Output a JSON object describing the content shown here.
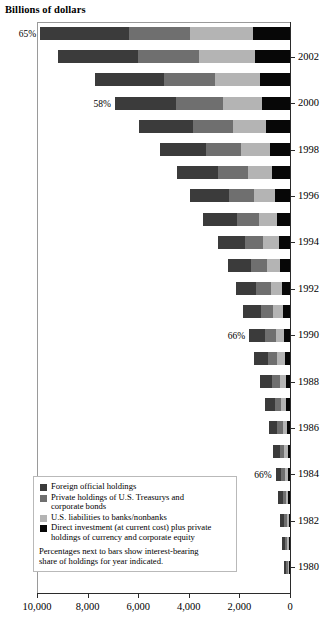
{
  "chart_data": {
    "type": "bar",
    "orientation": "horizontal-stacked",
    "title": "Billions of dollars",
    "xlabel": "",
    "ylabel": "",
    "xlim": [
      10000,
      0
    ],
    "x_reversed": true,
    "xticks": [
      10000,
      8000,
      6000,
      4000,
      2000,
      0
    ],
    "xticklabels": [
      "10,000",
      "8,000",
      "6,000",
      "4,000",
      "2,000",
      "0"
    ],
    "grid": false,
    "legend_position": "inside-lower-left",
    "categories": [
      2003,
      2002,
      2001,
      2000,
      1999,
      1998,
      1997,
      1996,
      1995,
      1994,
      1993,
      1992,
      1991,
      1990,
      1989,
      1988,
      1987,
      1986,
      1985,
      1984,
      1983,
      1982,
      1981,
      1980
    ],
    "ytick_years": [
      2002,
      2000,
      1998,
      1996,
      1994,
      1992,
      1990,
      1988,
      1986,
      1984,
      1982,
      1980
    ],
    "series": [
      {
        "name": "Foreign official holdings",
        "color": "#3b3b3b",
        "values": [
          3520,
          3170,
          2730,
          2420,
          2140,
          1800,
          1620,
          1520,
          1360,
          1060,
          930,
          790,
          700,
          620,
          560,
          470,
          400,
          320,
          270,
          225,
          185,
          150,
          120,
          100
        ]
      },
      {
        "name": "Private holdings of U.S. Treasurys and corporate bonds",
        "color": "#6f6f6f",
        "values": [
          2390,
          2410,
          2020,
          1870,
          1590,
          1390,
          1170,
          1000,
          880,
          740,
          640,
          560,
          480,
          420,
          370,
          310,
          260,
          215,
          175,
          150,
          125,
          100,
          82,
          68
        ]
      },
      {
        "name": "U.S. liabilities to banks/nonbanks",
        "color": "#b4b4b4",
        "values": [
          2500,
          2210,
          1790,
          1540,
          1310,
          1120,
          970,
          830,
          700,
          610,
          520,
          450,
          390,
          330,
          290,
          240,
          200,
          165,
          135,
          110,
          92,
          75,
          62,
          50
        ]
      },
      {
        "name": "Direct investment (at current cost) plus private holdings of currency and corporate equity",
        "color": "#070707",
        "values": [
          1460,
          1380,
          1180,
          1090,
          940,
          810,
          700,
          600,
          510,
          440,
          380,
          320,
          280,
          240,
          210,
          175,
          145,
          120,
          98,
          80,
          66,
          54,
          44,
          36
        ]
      }
    ],
    "annotations": [
      {
        "year": 2003,
        "label": "65%"
      },
      {
        "year": 2000,
        "label": "58%"
      },
      {
        "year": 1990,
        "label": "66%"
      },
      {
        "year": 1984,
        "label": "66%"
      }
    ]
  },
  "legend": {
    "items": [
      {
        "swatch": "s0",
        "lines": [
          "Foreign official holdings"
        ]
      },
      {
        "swatch": "s1",
        "lines": [
          "Private holdings of U.S. Treasurys and",
          "corporate bonds"
        ]
      },
      {
        "swatch": "s2",
        "lines": [
          "U.S. liabilities to banks/nonbanks"
        ]
      },
      {
        "swatch": "s3",
        "lines": [
          "Direct investment (at current cost) plus private",
          "holdings of currency and corporate equity"
        ]
      }
    ],
    "note_line1": "Percentages next to bars show interest-bearing",
    "note_line2": "share of holdings for year indicated."
  },
  "legend_text": {
    "i0l0": "Foreign official holdings",
    "i1l0": "Private holdings of U.S. Treasurys and",
    "i1l1": "corporate bonds",
    "i2l0": "U.S. liabilities to banks/nonbanks",
    "i3l0": "Direct investment (at current cost) plus private",
    "i3l1": "holdings of currency and corporate equity"
  }
}
